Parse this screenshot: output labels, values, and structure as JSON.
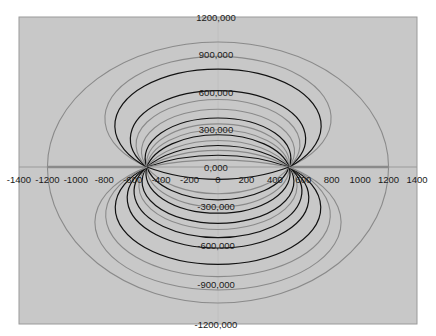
{
  "chart_data": {
    "type": "line",
    "title": "",
    "xlabel": "",
    "ylabel": "",
    "xlim": [
      -1400,
      1400
    ],
    "ylim": [
      -1200000,
      1200000
    ],
    "grid": false,
    "legend": null,
    "x_ticks": [
      -1400,
      -1200,
      -1000,
      -800,
      -600,
      -400,
      -200,
      0,
      200,
      400,
      600,
      800,
      1000,
      1200,
      1400
    ],
    "x_tick_labels": [
      "-1400",
      "-1200",
      "-1000",
      "-800",
      "-600",
      "-400",
      "-200",
      "0",
      "200",
      "400",
      "600",
      "800",
      "1000",
      "1200",
      "1400"
    ],
    "y_ticks": [
      1200000,
      900000,
      600000,
      300000,
      0,
      -300000,
      -600000,
      -900000,
      -1200000
    ],
    "y_tick_labels": [
      "1200,000",
      "900,000",
      "600,000",
      "300,000",
      "0,000",
      "-300,000",
      "-600,000",
      "-900,000",
      "-1200,000"
    ],
    "foci_x": [
      -500,
      500
    ],
    "outer_ellipse": {
      "x_radius": 1200,
      "y_top": 1000000,
      "y_bottom": -1040000,
      "color": "gray"
    },
    "axis_segments": [
      [
        -1200,
        -500
      ],
      [
        500,
        1200
      ]
    ],
    "upper_curves": [
      {
        "y_at_center": 885000,
        "color": "gray"
      },
      {
        "y_at_center": 783000,
        "color": "black"
      },
      {
        "y_at_center": 611000,
        "color": "black"
      },
      {
        "y_at_center": 540000,
        "color": "gray"
      },
      {
        "y_at_center": 462000,
        "color": "gray"
      },
      {
        "y_at_center": 392000,
        "color": "black"
      },
      {
        "y_at_center": 345000,
        "color": "gray"
      },
      {
        "y_at_center": 298000,
        "color": "gray"
      },
      {
        "y_at_center": 258000,
        "color": "black"
      },
      {
        "y_at_center": 212000,
        "color": "gray"
      },
      {
        "y_at_center": 172000,
        "color": "black"
      },
      {
        "y_at_center": 133000,
        "color": "gray"
      },
      {
        "y_at_center": 94000,
        "color": "black"
      },
      {
        "y_at_center": 55000,
        "color": "gray"
      }
    ],
    "lower_curves": [
      {
        "y_at_center": -94000,
        "color": "black"
      },
      {
        "y_at_center": -204000,
        "color": "gray"
      },
      {
        "y_at_center": -251000,
        "color": "black"
      },
      {
        "y_at_center": -306000,
        "color": "gray"
      },
      {
        "y_at_center": -353000,
        "color": "black"
      },
      {
        "y_at_center": -431000,
        "color": "black"
      },
      {
        "y_at_center": -478000,
        "color": "gray"
      },
      {
        "y_at_center": -540000,
        "color": "black"
      },
      {
        "y_at_center": -619000,
        "color": "black"
      },
      {
        "y_at_center": -744000,
        "color": "black"
      },
      {
        "y_at_center": -838000,
        "color": "gray"
      },
      {
        "y_at_center": -940000,
        "color": "gray"
      }
    ],
    "colors": {
      "background": "#c8c8c8",
      "gray": "#8a8a8a",
      "black": "#111111",
      "axis": "#9a9a9a"
    }
  }
}
